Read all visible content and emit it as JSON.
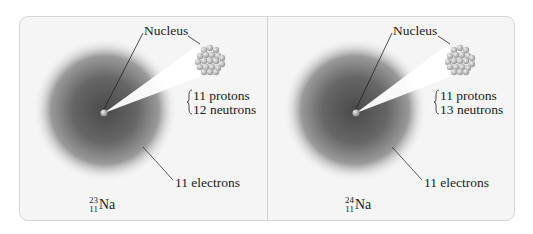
{
  "figure": {
    "colors": {
      "frame_bg": "#f5f5f5",
      "frame_border": "#d6d6d6",
      "cloud_center": "#4a4a4a",
      "cone": "#ffffff",
      "text": "#222222"
    },
    "panels": [
      {
        "nucleus_label": "Nucleus",
        "protons": "11 protons",
        "neutrons": "12 neutrons",
        "electrons": "11 electrons",
        "isotope": {
          "mass_number": "23",
          "atomic_number": "11",
          "symbol": "Na"
        }
      },
      {
        "nucleus_label": "Nucleus",
        "protons": "11 protons",
        "neutrons": "13 neutrons",
        "electrons": "11 electrons",
        "isotope": {
          "mass_number": "24",
          "atomic_number": "11",
          "symbol": "Na"
        }
      }
    ]
  }
}
